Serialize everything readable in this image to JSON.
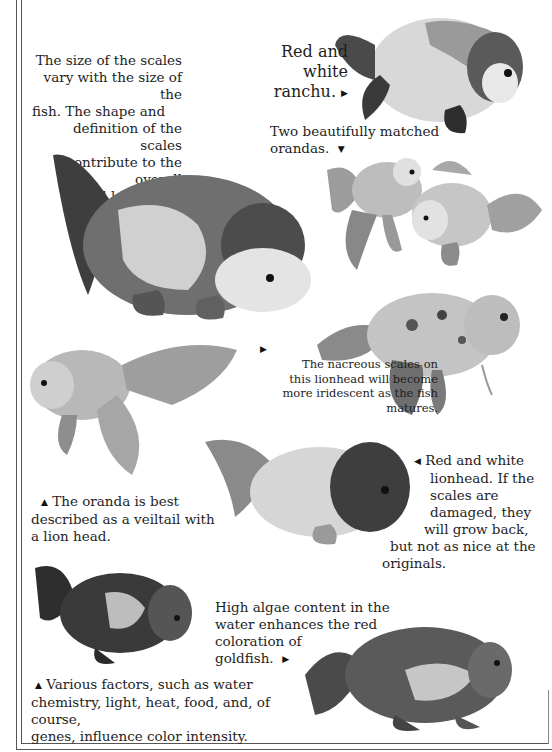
{
  "captions": {
    "scales_size": {
      "lines": [
        "The size of the scales",
        "vary with the size of the",
        "fish. The shape and",
        "definition of the scales",
        "contribute to the overall",
        "good looks of",
        "the fish."
      ],
      "pointer": "down-arrow"
    },
    "red_white_ranchu": {
      "lines": [
        "Red and white",
        "ranchu."
      ],
      "pointer": "right-arrow"
    },
    "matched_orandas": {
      "lines": [
        "Two beautifully matched",
        "orandas."
      ],
      "pointer": "down-arrow"
    },
    "nacreous_scales": {
      "lines": [
        "The nacreous scales on",
        "this lionhead will become",
        "more iridescent as the fish",
        "matures."
      ],
      "pointer": "up-right-arrow"
    },
    "red_white_lionhead": {
      "lines": [
        "Red and white",
        "lionhead. If the",
        "scales are",
        "damaged, they",
        "will grow back,",
        "but not as nice at the",
        "originals."
      ],
      "pointer": "left-arrow"
    },
    "oranda_veiltail": {
      "lines": [
        "The oranda is best",
        "described as a veiltail with",
        "a lion head."
      ],
      "pointer": "up-arrow"
    },
    "high_algae": {
      "lines": [
        "High algae content in the",
        "water enhances the red",
        "coloration of",
        "goldfish."
      ],
      "pointer": "right-arrow"
    },
    "various_factors": {
      "lines": [
        "Various factors, such as water",
        "chemistry, light, heat, food, and, of course,",
        "genes, influence color intensity."
      ],
      "pointer": "up-arrow"
    }
  },
  "icons": {
    "down": "▼",
    "up": "▲",
    "right": "▶",
    "left": "◀"
  },
  "images": [
    {
      "id": "ranchu-top-right",
      "subject": "Red and white ranchu"
    },
    {
      "id": "ranchu-large-center",
      "subject": "Ranchu showing scales"
    },
    {
      "id": "orandas-pair",
      "subject": "Two matched orandas"
    },
    {
      "id": "lionhead-nacreous",
      "subject": "Nacreous-scaled lionhead"
    },
    {
      "id": "oranda-left",
      "subject": "Oranda veiltail"
    },
    {
      "id": "lionhead-red-white",
      "subject": "Red and white lionhead"
    },
    {
      "id": "ranchu-dark-bottom-left",
      "subject": "Dark ranchu"
    },
    {
      "id": "ranchu-bottom-right",
      "subject": "Red goldfish with algae coloration"
    }
  ]
}
